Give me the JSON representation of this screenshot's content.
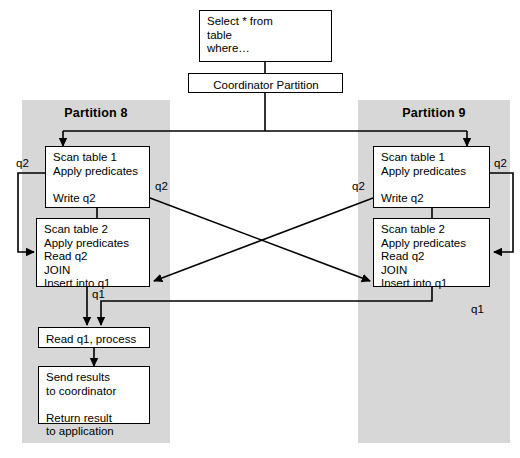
{
  "diagram": {
    "title_nodes": {
      "query": "Select * from\ntable\nwhere…",
      "coordinator": "Coordinator Partition"
    },
    "partitions": [
      {
        "id": "partition-8",
        "title": "Partition 8",
        "steps": [
          {
            "id": "scan-table-1",
            "text": "Scan table 1\nApply predicates\n\nWrite q2"
          },
          {
            "id": "scan-table-2",
            "text": "Scan table 2\nApply predicates\nRead q2\nJOIN\nInsert into q1"
          },
          {
            "id": "read-q1-process",
            "text": "Read q1, process"
          },
          {
            "id": "send-results",
            "text": "Send results\nto coordinator\n\nReturn result\nto application"
          }
        ]
      },
      {
        "id": "partition-9",
        "title": "Partition 9",
        "steps": [
          {
            "id": "scan-table-1",
            "text": "Scan table 1\nApply predicates\n\nWrite q2"
          },
          {
            "id": "scan-table-2",
            "text": "Scan table 2\nApply predicates\nRead q2\nJOIN\nInsert into q1"
          }
        ]
      }
    ],
    "edge_labels": {
      "q2_left_loop": "q2",
      "q2_left_cross": "q2",
      "q2_right_loop": "q2",
      "q2_right_cross": "q2",
      "q1_left": "q1",
      "q1_right": "q1"
    },
    "colors": {
      "panel_fill": "#d7d7d7",
      "box_fill": "#ffffff",
      "stroke": "#000000",
      "page_background": "#ffffff"
    }
  }
}
